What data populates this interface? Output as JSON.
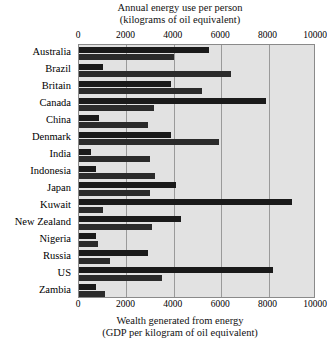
{
  "chart_data": {
    "type": "bar",
    "orientation": "horizontal",
    "title_top": "Annual energy use per person",
    "subtitle_top": "(kilograms of oil equivalent)",
    "title_bottom": "Wealth generated from energy",
    "subtitle_bottom": "(GDP per kilogram of oil equivalent)",
    "xlabel": "",
    "ylabel": "",
    "xlim": [
      0,
      10000
    ],
    "xticks": [
      0,
      2000,
      4000,
      6000,
      8000,
      10000
    ],
    "xticklabels": [
      "0",
      "2000",
      "4000",
      "6000",
      "8000",
      "10000"
    ],
    "grid": true,
    "legend": "none",
    "categories": [
      "Australia",
      "Brazil",
      "Britain",
      "Canada",
      "China",
      "Denmark",
      "India",
      "Indonesia",
      "Japan",
      "Kuwait",
      "New Zealand",
      "Nigeria",
      "Russia",
      "US",
      "Zambia"
    ],
    "series": [
      {
        "name": "Annual energy use per person",
        "units": "kilograms of oil equivalent",
        "values": [
          5500,
          1000,
          3900,
          7900,
          850,
          3900,
          500,
          700,
          4100,
          9000,
          4300,
          700,
          2900,
          8200,
          700
        ]
      },
      {
        "name": "Wealth generated from energy",
        "units": "GDP per kilogram of oil equivalent",
        "values": [
          4000,
          6400,
          5200,
          3150,
          2900,
          5900,
          3000,
          3200,
          3000,
          1000,
          3100,
          800,
          1300,
          3500,
          1100
        ]
      }
    ],
    "colors": {
      "bar": "#1a1a1a",
      "plot_background": "#e2e2e2",
      "gridline": "#9a9a9a",
      "border": "#8a8a8a"
    }
  }
}
